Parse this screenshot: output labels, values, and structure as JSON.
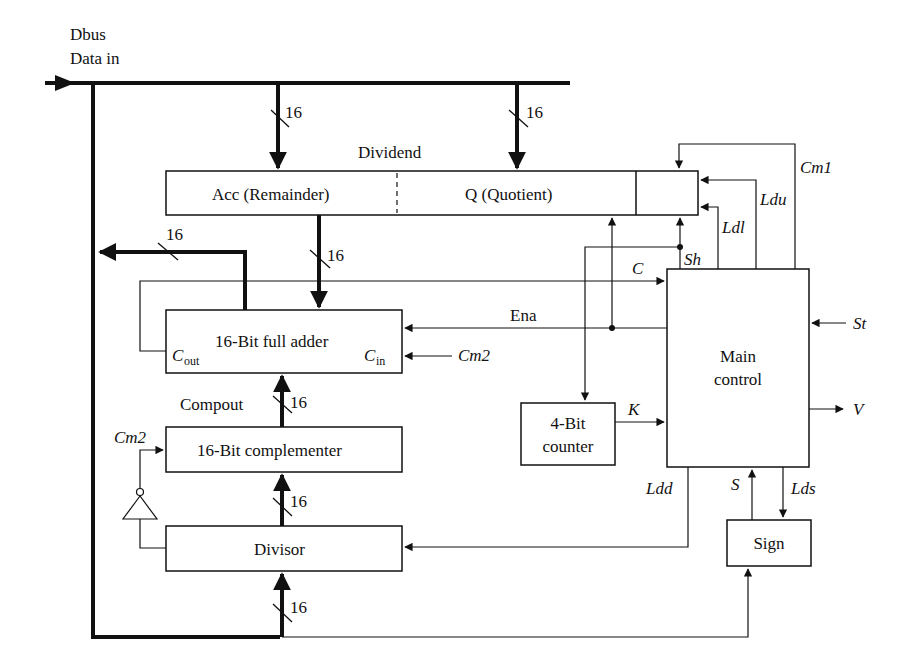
{
  "diagram": {
    "type": "block-diagram",
    "bus": {
      "label_line1": "Dbus",
      "label_line2": "Data in"
    },
    "bit_width": "16",
    "blocks": {
      "register_title": "Dividend",
      "acc": "Acc (Remainder)",
      "quotient": "Q (Quotient)",
      "adder": "16-Bit full adder",
      "adder_cout_main": "C",
      "adder_cout_sub": "out",
      "adder_cin_main": "C",
      "adder_cin_sub": "in",
      "complementer": "16-Bit complementer",
      "divisor": "Divisor",
      "main_control_line1": "Main",
      "main_control_line2": "control",
      "counter_line1": "4-Bit",
      "counter_line2": "counter",
      "sign": "Sign"
    },
    "signals": {
      "compout": "Compout",
      "cm1": "Cm1",
      "cm2_adder": "Cm2",
      "cm2_comp": "Cm2",
      "ldu": "Ldu",
      "ldl": "Ldl",
      "sh": "Sh",
      "c": "C",
      "ena": "Ena",
      "st": "St",
      "v": "V",
      "k": "K",
      "ldd": "Ldd",
      "s": "S",
      "lds": "Lds"
    }
  }
}
